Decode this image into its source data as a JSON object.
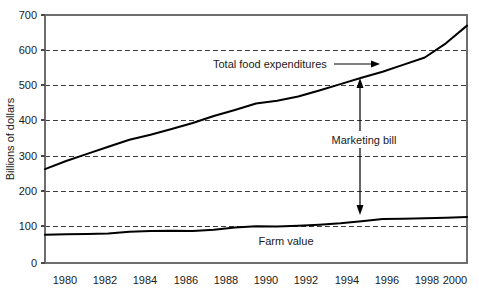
{
  "chart_data": {
    "type": "line",
    "title": "",
    "xlabel": "",
    "ylabel": "Billions of dollars",
    "xlim": [
      1980,
      2000
    ],
    "ylim": [
      0,
      700
    ],
    "grid": true,
    "legend_position": "inline-annotations",
    "x": [
      1980,
      1981,
      1982,
      1983,
      1984,
      1985,
      1986,
      1987,
      1988,
      1989,
      1990,
      1991,
      1992,
      1993,
      1994,
      1995,
      1996,
      1997,
      1998,
      1999,
      2000
    ],
    "y_ticks": [
      0,
      100,
      200,
      300,
      400,
      500,
      600,
      700
    ],
    "y_tick_labels": [
      "0",
      "100",
      "200",
      "300",
      "400",
      "500",
      "600",
      "700"
    ],
    "x_ticks": [
      1980,
      1982,
      1984,
      1986,
      1988,
      1990,
      1992,
      1994,
      1996,
      1998,
      2000
    ],
    "x_tick_labels": [
      "1980",
      "1982",
      "1984",
      "1986",
      "1988",
      "1990",
      "1992",
      "1994",
      "1996",
      "1998",
      "2000"
    ],
    "series": [
      {
        "name": "Total food expenditures",
        "color": "#000000",
        "values": [
          265,
          288,
          308,
          328,
          348,
          362,
          378,
          395,
          415,
          432,
          450,
          458,
          470,
          487,
          505,
          523,
          540,
          560,
          580,
          620,
          670
        ]
      },
      {
        "name": "Farm value",
        "color": "#000000",
        "values": [
          80,
          81,
          82,
          83,
          88,
          90,
          91,
          90,
          94,
          100,
          104,
          103,
          105,
          108,
          112,
          118,
          124,
          125,
          126,
          128,
          130
        ]
      }
    ],
    "annotations": [
      {
        "name": "total-food-expenditures-label",
        "text": "Total food expenditures",
        "type": "label-with-arrow",
        "arrow": "horizontal-right",
        "arrow_target_year": 1995,
        "arrow_target_value": 530
      },
      {
        "name": "marketing-bill-label",
        "text": "Marketing bill",
        "type": "label-with-double-arrow",
        "arrow": "vertical-double",
        "arrow_year": 1995,
        "arrow_top_value": 525,
        "arrow_bottom_value": 145
      },
      {
        "name": "farm-value-label",
        "text": "Farm value",
        "type": "label",
        "arrow": "none"
      }
    ]
  },
  "axis": {
    "y_title": "Billions of dollars"
  },
  "colors": {
    "line": "#000000",
    "grid": "#3c3c3c",
    "frame": "#6e6e6e",
    "text": "#1a1a1a",
    "background": "#ffffff"
  }
}
